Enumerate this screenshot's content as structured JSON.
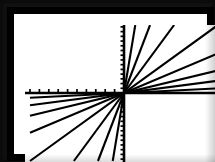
{
  "screen": {
    "title": "Graphing calculator plot",
    "background_color": "#ffffff",
    "ink_color": "#000000",
    "frame_color": "#000000"
  },
  "chart_data": {
    "type": "line",
    "subtitle": "",
    "xlabel": "x",
    "ylabel": "y",
    "xlim": [
      -10,
      10
    ],
    "ylim": [
      -7.2,
      7.2
    ],
    "grid": false,
    "legend": "none",
    "axes": {
      "x_axis_visible": true,
      "y_axis_visible": true,
      "origin_x": 0,
      "origin_y": 0,
      "x_tick_step": 1,
      "y_tick_step": 0.5,
      "x_ticks_drawn_on": "negative x only",
      "y_ticks_drawn_on": "full y axis",
      "x_tick_values": [
        -10,
        -9,
        -8,
        -7,
        -6,
        -5,
        -4,
        -3,
        -2,
        -1
      ],
      "y_tick_values": [
        -7,
        -6.5,
        -6,
        -5.5,
        -5,
        -4.5,
        -4,
        -3.5,
        -3,
        -2.5,
        -2,
        -1.5,
        -1,
        -0.5,
        0.5,
        1,
        1.5,
        2,
        2.5,
        3,
        3.5,
        4,
        4.5,
        5,
        5.5,
        6,
        6.5,
        7
      ]
    },
    "x": [
      -10,
      10
    ],
    "series": [
      {
        "name": "y = 6x",
        "slope": 6,
        "values": [
          -60,
          60
        ]
      },
      {
        "name": "y = 2.6x",
        "slope": 2.6,
        "values": [
          -26,
          26
        ]
      },
      {
        "name": "y = 1.35x",
        "slope": 1.35,
        "values": [
          -13.5,
          13.5
        ]
      },
      {
        "name": "y = 0.72x",
        "slope": 0.72,
        "values": [
          -7.2,
          7.2
        ]
      },
      {
        "name": "y = 0.42x",
        "slope": 0.42,
        "values": [
          -4.2,
          4.2
        ]
      },
      {
        "name": "y = 0.24x",
        "slope": 0.24,
        "values": [
          -2.4,
          2.4
        ]
      },
      {
        "name": "y = 0.13x",
        "slope": 0.13,
        "values": [
          -1.3,
          1.3
        ]
      },
      {
        "name": "y = 0.05x",
        "slope": 0.05,
        "values": [
          -0.5,
          0.5
        ]
      }
    ],
    "annotations": [
      "All lines pass through the origin",
      "Slopes increase from nearly flat to nearly vertical"
    ]
  }
}
